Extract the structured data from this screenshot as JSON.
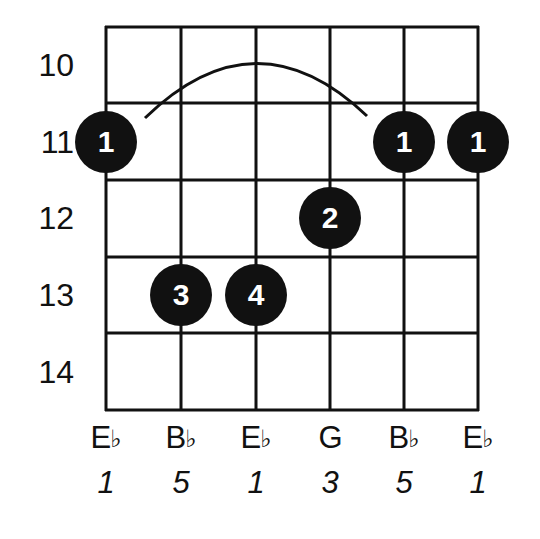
{
  "chord": {
    "root": "E♭",
    "frets_shown": [
      "10",
      "11",
      "12",
      "13",
      "14"
    ],
    "strings": [
      {
        "note": "E",
        "accidental": "♭",
        "interval": "1"
      },
      {
        "note": "B",
        "accidental": "♭",
        "interval": "5"
      },
      {
        "note": "E",
        "accidental": "♭",
        "interval": "1"
      },
      {
        "note": "G",
        "accidental": "",
        "interval": "3"
      },
      {
        "note": "B",
        "accidental": "♭",
        "interval": "5"
      },
      {
        "note": "E",
        "accidental": "♭",
        "interval": "1"
      }
    ],
    "fingers": [
      {
        "string": 1,
        "fret": "11",
        "finger": "1"
      },
      {
        "string": 5,
        "fret": "11",
        "finger": "1"
      },
      {
        "string": 6,
        "fret": "11",
        "finger": "1"
      },
      {
        "string": 4,
        "fret": "12",
        "finger": "2"
      },
      {
        "string": 2,
        "fret": "13",
        "finger": "3"
      },
      {
        "string": 3,
        "fret": "13",
        "finger": "4"
      }
    ],
    "barre": {
      "fret": "11",
      "from_string": 1,
      "to_string": 5,
      "finger": "1"
    }
  },
  "colors": {
    "line": "#111111",
    "dot_fill": "#111111",
    "dot_text": "#ffffff",
    "background": "#ffffff"
  }
}
